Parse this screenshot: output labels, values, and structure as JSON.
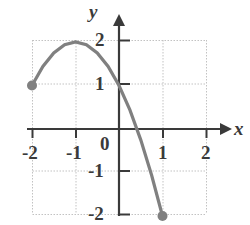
{
  "chart_data": {
    "type": "line",
    "title": "",
    "xlabel": "x",
    "ylabel": "y",
    "xlim": [
      -2.4,
      2.4
    ],
    "ylim": [
      -2.3,
      2.3
    ],
    "grid": true,
    "legend": null,
    "x_ticks": [
      "-2",
      "-1",
      "0",
      "1",
      "2"
    ],
    "x_tick_values": [
      -2,
      -1,
      0,
      1,
      2
    ],
    "y_ticks": [
      "2",
      "1",
      "-1",
      "-2"
    ],
    "y_tick_values": [
      2,
      1,
      -1,
      -2
    ],
    "origin_label": "0",
    "series": [
      {
        "name": "parabola",
        "equation": "y = -(x + 1)^2 + 2",
        "color": "#808080",
        "domain": [
          -2,
          1
        ],
        "vertex": [
          -1,
          2
        ],
        "x": [
          -2,
          -1.75,
          -1.5,
          -1.25,
          -1,
          -0.75,
          -0.5,
          -0.25,
          0,
          0.25,
          0.5,
          0.75,
          1
        ],
        "values": [
          1,
          1.4375,
          1.75,
          1.9375,
          2,
          1.9375,
          1.75,
          1.4375,
          1,
          0.4375,
          -0.25,
          -1.0625,
          -2
        ],
        "endpoints": [
          {
            "x": -2,
            "y": 1,
            "style": "closed"
          },
          {
            "x": 1,
            "y": -2,
            "style": "closed"
          }
        ]
      }
    ],
    "colors": {
      "curve": "#808080",
      "axis": "#3a3a3a",
      "grid": "#c9c9c9",
      "background": "#ffffff",
      "text": "#3a3a3a"
    }
  },
  "labels": {
    "x_axis": "x",
    "y_axis": "y",
    "origin": "0",
    "x_neg2": "-2",
    "x_neg1": "-1",
    "x_1": "1",
    "x_2": "2",
    "y_2": "2",
    "y_1": "1",
    "y_neg1": "-1",
    "y_neg2": "-2"
  }
}
